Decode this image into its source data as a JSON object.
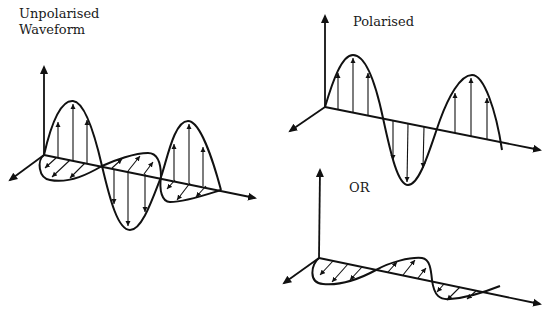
{
  "labels": {
    "unpolarised_line1": "Unpolarised",
    "unpolarised_line2": "Waveform",
    "polarised": "Polarised",
    "or": "OR"
  },
  "diagrams": [
    {
      "id": "unpolarised-waveform",
      "description": "Wave with vertical and horizontal oscillation components on 3D axes"
    },
    {
      "id": "polarised-vertical",
      "description": "Wave oscillating only in the vertical plane"
    },
    {
      "id": "polarised-horizontal",
      "description": "Wave oscillating only in the horizontal plane"
    }
  ],
  "colors": {
    "ink": "#111111",
    "background": "#ffffff"
  }
}
